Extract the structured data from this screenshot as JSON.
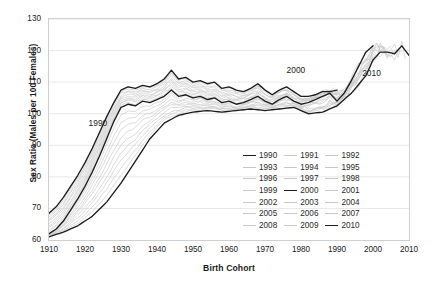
{
  "axes": {
    "ylabel": "Sex Ratio (Males per 100 Females)",
    "xlabel": "Birth Cohort",
    "yticks": [
      60,
      70,
      80,
      90,
      100,
      110,
      120,
      130
    ],
    "xticks": [
      1910,
      1920,
      1930,
      1940,
      1950,
      1960,
      1970,
      1980,
      1990,
      2000,
      2010
    ]
  },
  "annotations": [
    {
      "text": "1990",
      "x": 1921,
      "y": 97
    },
    {
      "text": "2000",
      "x": 1976,
      "y": 114
    },
    {
      "text": "2010",
      "x": 1997,
      "y": 113
    }
  ],
  "legend": {
    "items": [
      {
        "label": "1990",
        "highlight": true
      },
      {
        "label": "1991",
        "highlight": false
      },
      {
        "label": "1992",
        "highlight": false
      },
      {
        "label": "1993",
        "highlight": false
      },
      {
        "label": "1994",
        "highlight": false
      },
      {
        "label": "1995",
        "highlight": false
      },
      {
        "label": "1996",
        "highlight": false
      },
      {
        "label": "1997",
        "highlight": false
      },
      {
        "label": "1998",
        "highlight": false
      },
      {
        "label": "1999",
        "highlight": false
      },
      {
        "label": "2000",
        "highlight": true
      },
      {
        "label": "2001",
        "highlight": false
      },
      {
        "label": "2002",
        "highlight": false
      },
      {
        "label": "2003",
        "highlight": false
      },
      {
        "label": "2004",
        "highlight": false
      },
      {
        "label": "2005",
        "highlight": false
      },
      {
        "label": "2006",
        "highlight": false
      },
      {
        "label": "2007",
        "highlight": false
      },
      {
        "label": "2008",
        "highlight": false
      },
      {
        "label": "2009",
        "highlight": false
      },
      {
        "label": "2010",
        "highlight": true
      }
    ]
  },
  "colors": {
    "highlight": "#1c1c1c",
    "faint": "#c8c8c8",
    "grid": "#e8e8e8",
    "frame": "#cfcfcf",
    "background": "#ffffff"
  },
  "chart_data": {
    "type": "line",
    "title": "",
    "xlabel": "Birth Cohort",
    "ylabel": "Sex Ratio (Males per 100 Females)",
    "xlim": [
      1910,
      2010
    ],
    "ylim": [
      60,
      130
    ],
    "grid": true,
    "legend_position": "inside-bottom-right",
    "note": "Each series is a census year (1990-2010) giving sex ratio by birth cohort. Series 1990, 2000 and 2010 are drawn in black; intervening years in light grey.",
    "series": [
      {
        "name": "1990",
        "highlight": true,
        "x": [
          1910,
          1912,
          1914,
          1916,
          1918,
          1920,
          1922,
          1924,
          1926,
          1928,
          1930,
          1932,
          1934,
          1936,
          1938,
          1940,
          1942,
          1944,
          1946,
          1948,
          1950,
          1952,
          1954,
          1956,
          1958,
          1960,
          1962,
          1964,
          1966,
          1968,
          1970,
          1972,
          1974,
          1976,
          1978,
          1980,
          1982,
          1984,
          1986,
          1988,
          1990
        ],
        "y": [
          68.5,
          70.5,
          73.5,
          77.0,
          80.5,
          84.5,
          89.0,
          94.0,
          99.0,
          103.5,
          107.5,
          108.5,
          108.0,
          109.0,
          108.5,
          109.5,
          111.0,
          113.8,
          111.0,
          111.5,
          110.0,
          110.5,
          109.5,
          110.0,
          108.0,
          108.5,
          107.5,
          107.0,
          108.0,
          109.5,
          107.5,
          106.0,
          107.5,
          108.5,
          107.0,
          105.5,
          105.5,
          106.0,
          107.0,
          107.0,
          107.5
        ]
      },
      {
        "name": "2000",
        "highlight": true,
        "x": [
          1910,
          1912,
          1914,
          1916,
          1918,
          1920,
          1922,
          1924,
          1926,
          1928,
          1930,
          1932,
          1934,
          1936,
          1938,
          1940,
          1942,
          1944,
          1946,
          1948,
          1950,
          1952,
          1954,
          1956,
          1958,
          1960,
          1962,
          1964,
          1966,
          1968,
          1970,
          1972,
          1974,
          1976,
          1978,
          1980,
          1982,
          1984,
          1986,
          1988,
          1990,
          1992,
          1994,
          1996,
          1998,
          2000
        ],
        "y": [
          62.0,
          63.5,
          66.0,
          69.5,
          73.0,
          77.0,
          81.5,
          86.5,
          92.0,
          97.5,
          102.0,
          103.0,
          102.5,
          104.0,
          103.5,
          104.5,
          105.5,
          107.5,
          105.5,
          106.0,
          105.0,
          105.5,
          104.5,
          105.0,
          103.5,
          104.0,
          103.0,
          103.5,
          104.5,
          105.5,
          104.0,
          103.0,
          104.5,
          105.5,
          104.0,
          103.0,
          103.5,
          104.5,
          105.5,
          106.5,
          104.0,
          106.5,
          110.5,
          115.0,
          119.5,
          121.5
        ]
      },
      {
        "name": "2010",
        "highlight": true,
        "x": [
          1910,
          1914,
          1918,
          1922,
          1926,
          1930,
          1934,
          1938,
          1942,
          1946,
          1950,
          1954,
          1958,
          1962,
          1966,
          1970,
          1974,
          1978,
          1982,
          1986,
          1990,
          1994,
          1998,
          2000,
          2002,
          2004,
          2006,
          2008,
          2010
        ],
        "y": [
          61.0,
          62.5,
          64.5,
          67.5,
          72.0,
          78.0,
          85.0,
          92.0,
          97.0,
          99.5,
          100.5,
          101.0,
          100.5,
          101.0,
          101.5,
          101.0,
          101.5,
          102.0,
          100.0,
          100.5,
          102.5,
          106.5,
          112.0,
          117.0,
          119.5,
          119.5,
          119.0,
          121.5,
          118.5
        ]
      }
    ],
    "faint_series_count": 18,
    "faint_series_years": [
      1991,
      1992,
      1993,
      1994,
      1995,
      1996,
      1997,
      1998,
      1999,
      2001,
      2002,
      2003,
      2004,
      2005,
      2006,
      2007,
      2008,
      2009
    ]
  }
}
